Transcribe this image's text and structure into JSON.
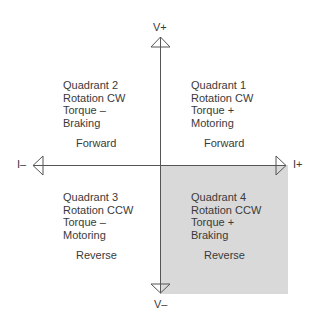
{
  "axes": {
    "v_plus": "V+",
    "v_minus": "V–",
    "i_minus": "I–",
    "i_plus": "I+"
  },
  "quadrants": [
    {
      "id": 1,
      "title": "Quadrant 1",
      "rotation": "Rotation CW",
      "torque": "Torque +",
      "mode": "Motoring",
      "direction": "Forward",
      "shaded": false
    },
    {
      "id": 2,
      "title": "Quadrant 2",
      "rotation": "Rotation CW",
      "torque": "Torque –",
      "mode": "Braking",
      "direction": "Forward",
      "shaded": false
    },
    {
      "id": 3,
      "title": "Quadrant 3",
      "rotation": "Rotation CCW",
      "torque": "Torque –",
      "mode": "Motoring",
      "direction": "Reverse",
      "shaded": false
    },
    {
      "id": 4,
      "title": "Quadrant 4",
      "rotation": "Rotation CCW",
      "torque": "Torque +",
      "mode": "Braking",
      "direction": "Reverse",
      "shaded": true
    }
  ],
  "colors": {
    "shade": "#d9d9d9",
    "line": "#555555",
    "text": "#3a3a3a"
  }
}
